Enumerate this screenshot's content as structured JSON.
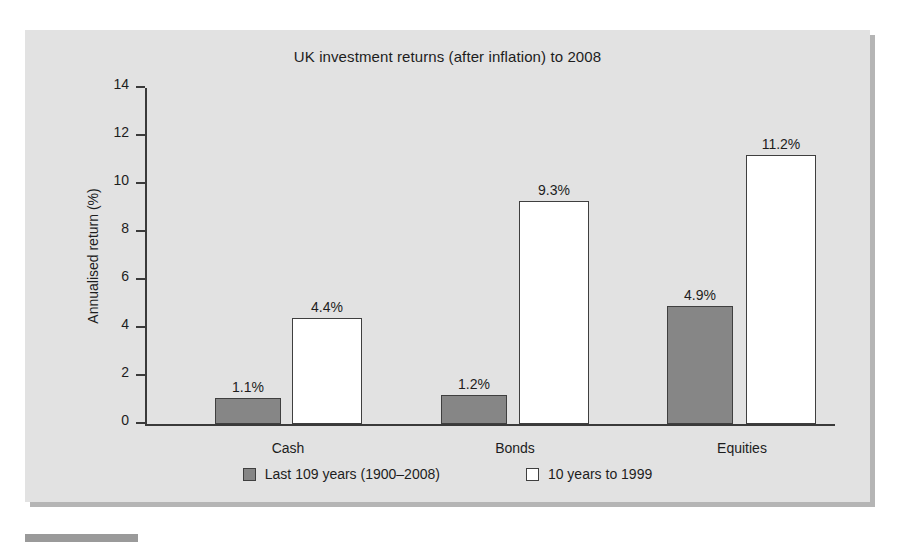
{
  "chart_data": {
    "type": "bar",
    "title": "UK investment returns (after inflation) to 2008",
    "xlabel": "",
    "ylabel": "Annualised return (%)",
    "categories": [
      "Cash",
      "Bonds",
      "Equities"
    ],
    "series": [
      {
        "name": "Last 109 years (1900–2008)",
        "color": "#868686",
        "values": [
          1.1,
          1.2,
          4.9
        ],
        "labels": [
          "1.1%",
          "1.2%",
          "4.9%"
        ]
      },
      {
        "name": "10 years to 1999",
        "color": "#ffffff",
        "values": [
          4.4,
          9.3,
          11.2
        ],
        "labels": [
          "4.4%",
          "9.3%",
          "11.2%"
        ]
      }
    ],
    "ylim": [
      0,
      14
    ],
    "yticks": [
      0,
      2,
      4,
      6,
      8,
      10,
      12,
      14
    ],
    "ytick_labels": [
      "0",
      "2",
      "4",
      "6",
      "8",
      "10",
      "12",
      "14"
    ],
    "grid": false,
    "legend_position": "bottom",
    "panel_background": "#e2e2e2",
    "axis_color": "#3a3a3a",
    "text_color": "#1d1d1d"
  }
}
